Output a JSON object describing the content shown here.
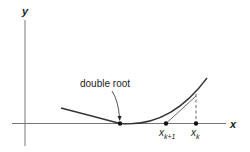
{
  "diagram": {
    "type": "newton-method-double-root",
    "axes": {
      "x_label": "x",
      "y_label": "y"
    },
    "annotations": {
      "double_root": "double root",
      "x_k_plus_1": {
        "base": "x",
        "sub": "k+1"
      },
      "x_k": {
        "base": "x",
        "sub": "k"
      }
    },
    "colors": {
      "line": "#333333",
      "axis": "#555555",
      "background": "#ffffff"
    }
  }
}
